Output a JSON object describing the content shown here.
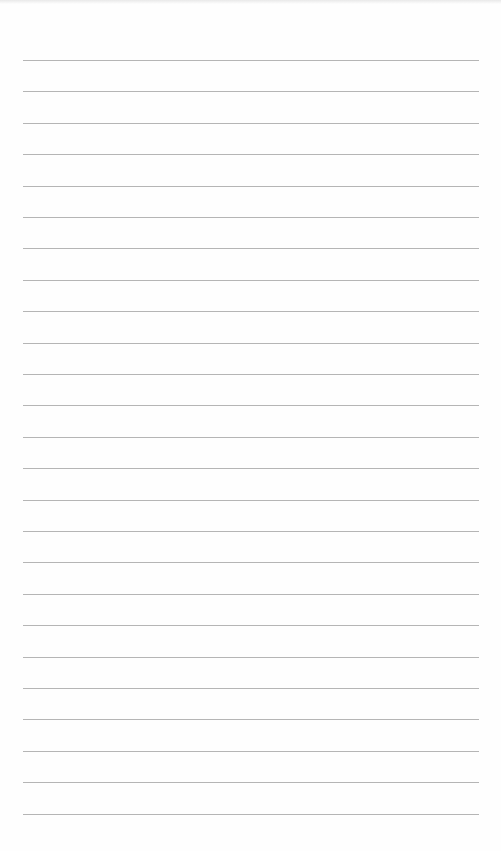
{
  "page": {
    "type": "blank-ruled-sheet",
    "line_count": 25,
    "first_line_y": 60,
    "line_spacing": 31.4,
    "line_left": 23,
    "line_right": 479,
    "line_color": "#a8a8a8",
    "background_color": "#fefefe"
  }
}
